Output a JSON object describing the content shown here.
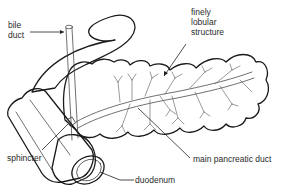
{
  "diagram": {
    "labels": {
      "bile_duct_line1": "bile",
      "bile_duct_line2": "duct",
      "lobular_line1": "finely",
      "lobular_line2": "lobular",
      "lobular_line3": "structure",
      "sphincter": "sphincter",
      "main_duct": "main pancreatic duct",
      "duodenum": "duodenum"
    },
    "colors": {
      "outline": "#1a1a1a",
      "shading": "#d9d9d9",
      "background": "#ffffff"
    }
  }
}
